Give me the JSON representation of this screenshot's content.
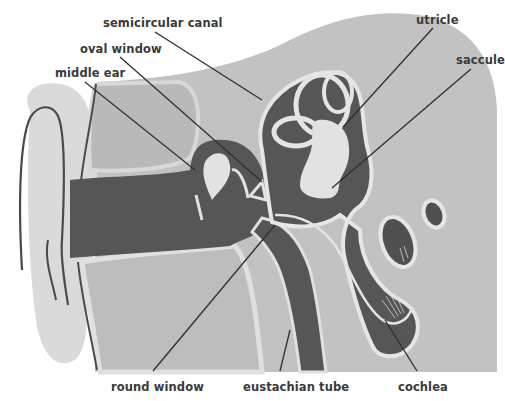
{
  "diagram": {
    "colors": {
      "background": "#ffffff",
      "tissue_light": "#d4d4d4",
      "tissue_mid": "#bdbdbd",
      "cavity_dark": "#565656",
      "fluid_pale": "#e2e2e2",
      "outline": "#4a4a4a",
      "label_text": "#3a3a3a",
      "leader_line": "#2e2e2e"
    },
    "labels": {
      "semicircular_canal": "semicircular canal",
      "oval_window": "oval window",
      "middle_ear": "middle ear",
      "utricle": "utricle",
      "saccule": "saccule",
      "round_window": "round window",
      "eustachian_tube": "eustachian tube",
      "cochlea": "cochlea"
    }
  }
}
